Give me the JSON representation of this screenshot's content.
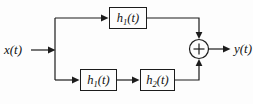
{
  "diagram_title": "parallel-system-block-diagram",
  "labels": {
    "input": "x(t)",
    "output": "y(t)"
  },
  "blocks": {
    "top": {
      "base": "h",
      "sub": "1",
      "arg": "(t)"
    },
    "bottom_first": {
      "base": "h",
      "sub": "1",
      "arg": "(t)"
    },
    "bottom_second": {
      "base": "h",
      "sub": "2",
      "arg": "(t)"
    }
  },
  "icons": {
    "summing_junction": "plus-icon"
  },
  "colors": {
    "line": "#1c1c1c",
    "background": "#fdfdfd",
    "text": "#111111"
  }
}
